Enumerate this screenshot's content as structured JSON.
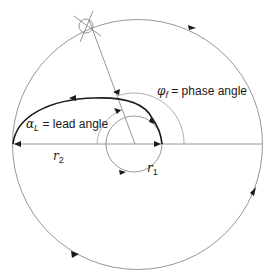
{
  "diagram": {
    "labels": {
      "phase_symbol": "φ",
      "phase_sub": "f",
      "phase_text": "= phase angle",
      "lead_symbol": "α",
      "lead_sub": "L",
      "lead_text": "= lead angle",
      "r2_symbol": "r",
      "r2_sub": "2",
      "r1_symbol": "r",
      "r1_sub": "1"
    },
    "elements": {
      "outer_circle": "outer circle radius r2",
      "inner_circle": "inner circle radius r1",
      "radial_line": "radial line to crosshair target",
      "crosshair": "crosshair target marker",
      "thick_path": "bold trajectory path",
      "phase_arc": "phase angle arc",
      "lead_arc": "lead angle arc"
    },
    "colors": {
      "line": "#8a8a8a",
      "bold": "#1a1a1a",
      "background": "#ffffff"
    }
  }
}
